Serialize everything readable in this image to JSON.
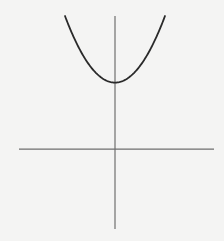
{
  "chart_data": {
    "type": "line",
    "title": "",
    "xlabel": "",
    "ylabel": "",
    "function": "y = x^2 + 1",
    "series": [
      {
        "name": "parabola",
        "x": [
          -1.0,
          -0.9,
          -0.8,
          -0.7,
          -0.6,
          -0.5,
          -0.4,
          -0.3,
          -0.2,
          -0.1,
          0.0,
          0.1,
          0.2,
          0.3,
          0.4,
          0.5,
          0.6,
          0.7,
          0.8,
          0.9,
          1.0
        ],
        "y": [
          2.0,
          1.81,
          1.64,
          1.49,
          1.36,
          1.25,
          1.16,
          1.09,
          1.04,
          1.01,
          1.0,
          1.01,
          1.04,
          1.09,
          1.16,
          1.25,
          1.36,
          1.49,
          1.64,
          1.81,
          2.0
        ]
      }
    ],
    "xlim": [
      -1.92,
      1.98
    ],
    "ylim": [
      -1.2,
      2.0
    ],
    "vertex": [
      0,
      1
    ],
    "grid": false,
    "legend": "none",
    "colors": {
      "curve": "#2a2a2a",
      "axes": "#6e6e6e",
      "background": "#f4f4f3"
    }
  }
}
